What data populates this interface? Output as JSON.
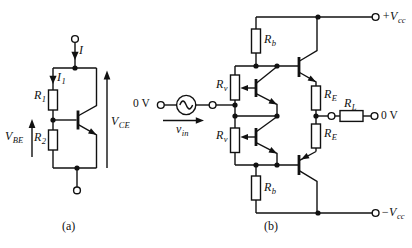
{
  "figure": {
    "caption_a": "(a)",
    "caption_b": "(b)",
    "line_color": "#111111",
    "background": "#ffffff"
  },
  "circuit_a": {
    "current_total": {
      "main": "I",
      "sub": ""
    },
    "current_branch": {
      "main": "I",
      "sub": "1"
    },
    "resistor_r1": {
      "main": "R",
      "sub": "1"
    },
    "resistor_r2": {
      "main": "R",
      "sub": "2"
    },
    "voltage_vbe": {
      "main": "V",
      "sub": "BE"
    },
    "voltage_vce": {
      "main": "V",
      "sub": "CE"
    }
  },
  "circuit_b": {
    "input_reference": "0 V",
    "input_signal": {
      "main": "v",
      "sub": "in"
    },
    "pot_upper": {
      "main": "R",
      "sub": "v"
    },
    "pot_lower": {
      "main": "R",
      "sub": "v"
    },
    "resistor_rb_upper": {
      "main": "R",
      "sub": "b"
    },
    "resistor_rb_lower": {
      "main": "R",
      "sub": "b"
    },
    "resistor_re_upper": {
      "main": "R",
      "sub": "E"
    },
    "resistor_re_lower": {
      "main": "R",
      "sub": "E"
    },
    "load_rl": {
      "main": "R",
      "sub": "L"
    },
    "output_reference": "0 V",
    "supply_positive": {
      "main": "+V",
      "sub": "cc"
    },
    "supply_negative": {
      "main": "−V",
      "sub": "cc"
    }
  }
}
